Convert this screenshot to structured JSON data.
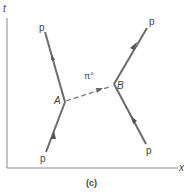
{
  "diagram": {
    "caption": "(c)",
    "axes": {
      "vertical_label": "t",
      "horizontal_label": "x"
    },
    "vertices": {
      "a": "A",
      "b": "B"
    },
    "exchange_particle": "π°",
    "particles": {
      "a_in": "p",
      "a_out": "p",
      "b_in": "p",
      "b_out": "p"
    },
    "colors": {
      "line": "#6b6b6b",
      "text": "#444444",
      "axis": "#7a7a7a"
    }
  }
}
